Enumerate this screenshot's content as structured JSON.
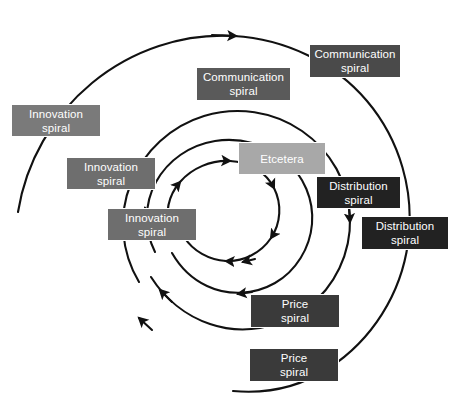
{
  "diagram": {
    "type": "spiral-cycle-diagram",
    "background": "#ffffff",
    "curve_color": "#111111",
    "colors": {
      "dark": "#222222",
      "medium_gray": "#6e6e6e",
      "light_gray": "#a8a8a8"
    },
    "center": {
      "x": 228,
      "y": 206
    },
    "flow_direction": "clockwise-outward",
    "nodes": [
      {
        "id": "innovation-spiral-inner",
        "line1": "Innovation",
        "line2": "spiral",
        "fill": "#6e6e6e",
        "x": 107,
        "y": 208,
        "w": 90,
        "h": 33,
        "ring": 1
      },
      {
        "id": "etcetera",
        "line1": "Etcetera",
        "line2": "",
        "fill": "#a8a8a8",
        "x": 238,
        "y": 142,
        "w": 88,
        "h": 33,
        "ring": 1
      },
      {
        "id": "communication-spiral-inner",
        "line1": "Communication",
        "line2": "spiral",
        "fill": "#5a5a5a",
        "x": 196,
        "y": 67,
        "w": 95,
        "h": 34,
        "ring": 2
      },
      {
        "id": "distribution-spiral-inner",
        "line1": "Distribution",
        "line2": "spiral",
        "fill": "#222222",
        "x": 316,
        "y": 176,
        "w": 85,
        "h": 33,
        "ring": 2
      },
      {
        "id": "price-spiral-inner",
        "line1": "Price",
        "line2": "spiral",
        "fill": "#3a3a3a",
        "x": 250,
        "y": 294,
        "w": 90,
        "h": 34,
        "ring": 2
      },
      {
        "id": "innovation-spiral-middle",
        "line1": "Innovation",
        "line2": "spiral",
        "fill": "#6e6e6e",
        "x": 66,
        "y": 157,
        "w": 90,
        "h": 33,
        "ring": 2
      },
      {
        "id": "communication-spiral-outer",
        "line1": "Communication",
        "line2": "spiral",
        "fill": "#4a4a4a",
        "x": 309,
        "y": 44,
        "w": 92,
        "h": 34,
        "ring": 3
      },
      {
        "id": "distribution-spiral-outer",
        "line1": "Distribution",
        "line2": "spiral",
        "fill": "#222222",
        "x": 361,
        "y": 216,
        "w": 88,
        "h": 34,
        "ring": 3
      },
      {
        "id": "price-spiral-outer",
        "line1": "Price",
        "line2": "spiral",
        "fill": "#3a3a3a",
        "x": 249,
        "y": 348,
        "w": 90,
        "h": 34,
        "ring": 3
      },
      {
        "id": "innovation-spiral-outer",
        "line1": "Innovation",
        "line2": "spiral",
        "fill": "#7a7a7a",
        "x": 11,
        "y": 104,
        "w": 90,
        "h": 33,
        "ring": 3
      }
    ]
  }
}
